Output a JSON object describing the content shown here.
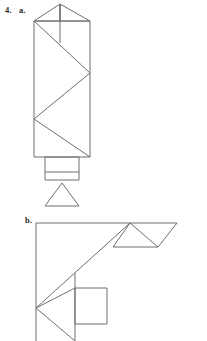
{
  "page": {
    "background_color": "#ffffff",
    "stroke_color": "#6e6e6e",
    "text_color": "#2b2b2b",
    "width": 207,
    "height": 341
  },
  "labels": {
    "number": "4.",
    "part_a": "a.",
    "part_b": "b."
  },
  "figures": [
    {
      "id": "figure-a",
      "name": "tangram-figure-a",
      "description": "vertical tower tangram figure",
      "pieces": [
        {
          "name": "apex-left-triangle",
          "type": "polygon",
          "points": "60,4 34,21 60,21"
        },
        {
          "name": "apex-right-triangle",
          "type": "polygon",
          "points": "60,4 90,21 60,21"
        },
        {
          "name": "upper-body-rectangle",
          "type": "polygon",
          "points": "34,21 90,21 90,157 34,157"
        },
        {
          "name": "zigzag-diagonal-upper",
          "type": "polyline",
          "points": "34,21 90,73"
        },
        {
          "name": "zigzag-diagonal-middle",
          "type": "polyline",
          "points": "90,73 34,119"
        },
        {
          "name": "zigzag-diagonal-lower",
          "type": "polyline",
          "points": "34,119 90,157"
        },
        {
          "name": "apex-center-divider",
          "type": "polyline",
          "points": "60,4 60,43"
        },
        {
          "name": "base-square",
          "type": "polygon",
          "points": "45,157 79,157 79,180 45,180"
        },
        {
          "name": "base-square-inner-left",
          "type": "polyline",
          "points": "45,172 79,172"
        },
        {
          "name": "lower-triangle",
          "type": "polygon",
          "points": "62,183 79,206 45,206"
        }
      ]
    },
    {
      "id": "figure-b",
      "name": "tangram-figure-b",
      "description": "angular hook tangram figure",
      "pieces": [
        {
          "name": "left-vertical-edge",
          "type": "polyline",
          "points": "36,223 36,341"
        },
        {
          "name": "top-horizontal-edge",
          "type": "polyline",
          "points": "36,223 177,223"
        },
        {
          "name": "long-diagonal",
          "type": "polyline",
          "points": "36,308 130,223"
        },
        {
          "name": "top-right-triangle-left",
          "type": "polyline",
          "points": "130,223 113,247"
        },
        {
          "name": "top-right-triangle-base",
          "type": "polyline",
          "points": "113,247 158,247"
        },
        {
          "name": "top-right-triangle-right",
          "type": "polyline",
          "points": "158,247 130,223"
        },
        {
          "name": "top-right-outer-edge",
          "type": "polyline",
          "points": "158,247 177,223"
        },
        {
          "name": "bottom-left-chevron-upper",
          "type": "polyline",
          "points": "36,308 75,288"
        },
        {
          "name": "bottom-left-chevron-lower",
          "type": "polyline",
          "points": "36,308 75,341"
        },
        {
          "name": "right-square",
          "type": "polygon",
          "points": "75,288 107,288 107,324 75,324"
        },
        {
          "name": "square-connector-vertical",
          "type": "polyline",
          "points": "75,273 75,341"
        }
      ]
    }
  ]
}
